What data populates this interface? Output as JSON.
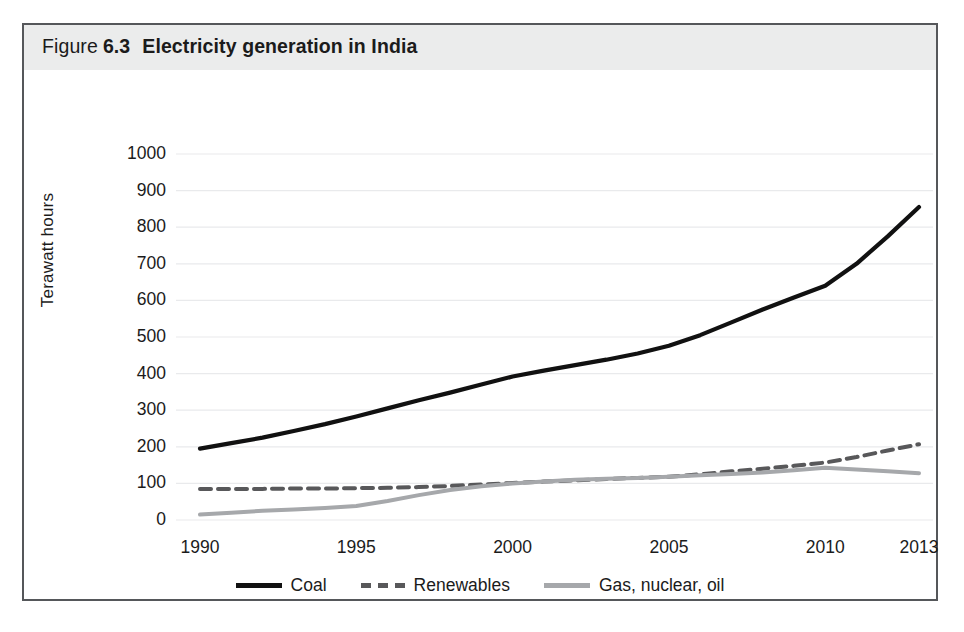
{
  "figure": {
    "label_word": "Figure",
    "number": "6.3",
    "title": "Electricity generation in India"
  },
  "chart_data": {
    "type": "line",
    "title": "Electricity generation in India",
    "xlabel": "",
    "ylabel": "Terawatt hours",
    "xlim": [
      1990,
      2013
    ],
    "ylim": [
      0,
      1000
    ],
    "ytick_labels": [
      "1000",
      "900",
      "800",
      "700",
      "600",
      "500",
      "400",
      "300",
      "200",
      "100",
      "0"
    ],
    "ytick_values": [
      1000,
      900,
      800,
      700,
      600,
      500,
      400,
      300,
      200,
      100,
      0
    ],
    "xtick_labels": [
      "1990",
      "1995",
      "2000",
      "2005",
      "2010",
      "2013"
    ],
    "xtick_values": [
      1990,
      1995,
      2000,
      2005,
      2010,
      2013
    ],
    "grid": true,
    "legend_position": "bottom",
    "x": [
      1990,
      1991,
      1992,
      1993,
      1994,
      1995,
      1996,
      1997,
      1998,
      1999,
      2000,
      2001,
      2002,
      2003,
      2004,
      2005,
      2006,
      2007,
      2008,
      2009,
      2010,
      2011,
      2012,
      2013
    ],
    "series": [
      {
        "name": "Coal",
        "color": "#111111",
        "style": "solid",
        "values": [
          195,
          210,
          225,
          243,
          262,
          283,
          305,
          327,
          348,
          370,
          392,
          408,
          423,
          438,
          455,
          476,
          505,
          540,
          575,
          608,
          640,
          700,
          775,
          855
        ]
      },
      {
        "name": "Renewables",
        "color": "#58585a",
        "style": "dashed",
        "values": [
          85,
          85,
          85,
          86,
          86,
          87,
          88,
          90,
          93,
          97,
          101,
          105,
          108,
          112,
          115,
          118,
          125,
          133,
          140,
          148,
          157,
          172,
          190,
          207
        ]
      },
      {
        "name": "Gas, nuclear, oil",
        "color": "#a6a8ab",
        "style": "solid",
        "values": [
          15,
          20,
          25,
          29,
          33,
          38,
          52,
          68,
          82,
          92,
          100,
          105,
          110,
          113,
          115,
          118,
          122,
          126,
          130,
          136,
          143,
          138,
          133,
          128
        ]
      }
    ]
  },
  "legend": {
    "items": [
      {
        "label": "Coal"
      },
      {
        "label": "Renewables"
      },
      {
        "label": "Gas, nuclear, oil"
      }
    ]
  },
  "caption": ""
}
